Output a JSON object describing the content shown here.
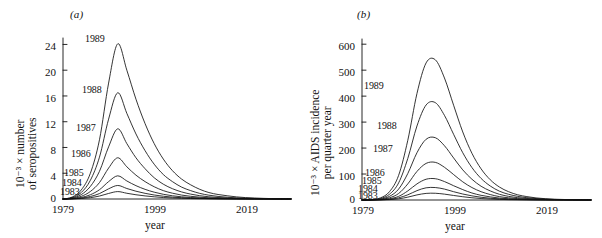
{
  "figure": {
    "panels": [
      {
        "tag": "(a)",
        "y_axis_label_line1": "10⁻³ × number",
        "y_axis_label_line2": "of seropositives",
        "x_axis_label": "year",
        "y_ticks": [
          "0",
          "4",
          "8",
          "12",
          "16",
          "20",
          "24"
        ],
        "x_ticks": [
          "1979",
          "1999",
          "2019"
        ],
        "curve_labels": [
          "1989",
          "1988",
          "1987",
          "1986",
          "1985",
          "1984",
          "1983"
        ]
      },
      {
        "tag": "(b)",
        "y_axis_label_line1": "10⁻³ × AIDS incidence",
        "y_axis_label_line2": "per quarter year",
        "x_axis_label": "year",
        "y_ticks": [
          "0",
          "100",
          "200",
          "300",
          "400",
          "500",
          "600"
        ],
        "x_ticks": [
          "1979",
          "1999",
          "2019"
        ],
        "curve_labels": [
          "1989",
          "1988",
          "1987",
          "1986",
          "1985",
          "1984",
          "1983"
        ]
      }
    ]
  },
  "chart_data": [
    {
      "type": "line",
      "panel": "(a)",
      "title": "",
      "xlabel": "year",
      "ylabel": "10^-3 x number of seropositives",
      "xlim": [
        1979,
        2029
      ],
      "ylim": [
        0,
        25
      ],
      "ytick_values": [
        0,
        4,
        8,
        12,
        16,
        20,
        24
      ],
      "xtick_values": [
        1979,
        1999,
        2019
      ],
      "grid": false,
      "legend": "inline curve labels",
      "x": [
        1979,
        1981,
        1983,
        1985,
        1987,
        1989,
        1991,
        1993,
        1995,
        1997,
        1999,
        2001,
        2003,
        2005,
        2007,
        2009,
        2011,
        2013,
        2015,
        2017,
        2019,
        2021,
        2023,
        2025,
        2027,
        2029
      ],
      "series": [
        {
          "name": "1989",
          "peak_year": 1990,
          "peak_value": 24.1,
          "values": [
            0,
            0.3,
            1.4,
            4.0,
            9.2,
            18.0,
            24.1,
            20.0,
            15.5,
            11.7,
            8.6,
            6.2,
            4.4,
            3.1,
            2.2,
            1.5,
            1.0,
            0.7,
            0.5,
            0.33,
            0.22,
            0.15,
            0.1,
            0.06,
            0.04,
            0.02
          ]
        },
        {
          "name": "1988",
          "peak_year": 1990,
          "peak_value": 16.5,
          "values": [
            0,
            0.22,
            1.0,
            2.9,
            6.5,
            12.4,
            16.5,
            13.3,
            10.1,
            7.5,
            5.4,
            3.8,
            2.7,
            1.85,
            1.3,
            0.87,
            0.59,
            0.4,
            0.27,
            0.18,
            0.12,
            0.08,
            0.05,
            0.033,
            0.02,
            0.012
          ]
        },
        {
          "name": "1987",
          "peak_year": 1990,
          "peak_value": 10.9,
          "values": [
            0,
            0.15,
            0.68,
            1.95,
            4.3,
            8.1,
            10.9,
            8.6,
            6.4,
            4.7,
            3.3,
            2.3,
            1.6,
            1.1,
            0.76,
            0.51,
            0.34,
            0.23,
            0.155,
            0.1,
            0.068,
            0.045,
            0.03,
            0.019,
            0.012,
            0.007
          ]
        },
        {
          "name": "1986",
          "peak_year": 1990,
          "peak_value": 6.4,
          "values": [
            0,
            0.09,
            0.41,
            1.17,
            2.55,
            4.8,
            6.4,
            5.0,
            3.7,
            2.7,
            1.9,
            1.3,
            0.9,
            0.61,
            0.42,
            0.28,
            0.19,
            0.13,
            0.085,
            0.056,
            0.037,
            0.024,
            0.016,
            0.01,
            0.006,
            0.004
          ]
        },
        {
          "name": "1985",
          "peak_year": 1990,
          "peak_value": 3.6,
          "values": [
            0,
            0.05,
            0.23,
            0.66,
            1.44,
            2.7,
            3.6,
            2.8,
            2.07,
            1.5,
            1.06,
            0.73,
            0.5,
            0.34,
            0.23,
            0.155,
            0.1,
            0.07,
            0.047,
            0.031,
            0.02,
            0.013,
            0.009,
            0.005,
            0.003,
            0.002
          ]
        },
        {
          "name": "1984",
          "peak_year": 1990,
          "peak_value": 2.1,
          "values": [
            0,
            0.03,
            0.135,
            0.39,
            0.84,
            1.58,
            2.1,
            1.63,
            1.21,
            0.88,
            0.62,
            0.43,
            0.29,
            0.2,
            0.135,
            0.09,
            0.06,
            0.04,
            0.027,
            0.018,
            0.012,
            0.008,
            0.005,
            0.003,
            0.002,
            0.001
          ]
        },
        {
          "name": "1983",
          "peak_year": 1990,
          "peak_value": 1.15,
          "values": [
            0,
            0.016,
            0.074,
            0.21,
            0.46,
            0.86,
            1.15,
            0.89,
            0.66,
            0.48,
            0.34,
            0.23,
            0.16,
            0.11,
            0.074,
            0.049,
            0.033,
            0.022,
            0.015,
            0.01,
            0.006,
            0.004,
            0.003,
            0.002,
            0.001,
            0.0005
          ]
        }
      ]
    },
    {
      "type": "line",
      "panel": "(b)",
      "title": "",
      "xlabel": "year",
      "ylabel": "10^-3 x AIDS incidence per quarter year",
      "xlim": [
        1979,
        2029
      ],
      "ylim": [
        0,
        620
      ],
      "ytick_values": [
        0,
        100,
        200,
        300,
        400,
        500,
        600
      ],
      "xtick_values": [
        1979,
        1999,
        2019
      ],
      "grid": false,
      "legend": "inline curve labels",
      "x": [
        1979,
        1981,
        1983,
        1985,
        1987,
        1989,
        1991,
        1993,
        1995,
        1997,
        1999,
        2001,
        2003,
        2005,
        2007,
        2009,
        2011,
        2013,
        2015,
        2017,
        2019,
        2021,
        2023,
        2025,
        2027,
        2029
      ],
      "series": [
        {
          "name": "1989",
          "peak_year": 1993,
          "peak_value": 540,
          "values": [
            0,
            1,
            8,
            32,
            95,
            230,
            410,
            528,
            540,
            470,
            365,
            262,
            180,
            120,
            78,
            50,
            32,
            20,
            13,
            8,
            5,
            3,
            2,
            1.2,
            0.7,
            0.4
          ]
        },
        {
          "name": "1988",
          "peak_year": 1993,
          "peak_value": 375,
          "values": [
            0,
            0.7,
            5.5,
            22,
            66,
            160,
            285,
            366,
            375,
            326,
            253,
            182,
            125,
            83,
            54,
            34,
            22,
            14,
            9,
            5.5,
            3.5,
            2.1,
            1.3,
            0.8,
            0.5,
            0.3
          ]
        },
        {
          "name": "1987",
          "peak_year": 1993,
          "peak_value": 240,
          "values": [
            0,
            0.45,
            3.5,
            14,
            42,
            102,
            182,
            234,
            240,
            209,
            162,
            116,
            80,
            53,
            35,
            22,
            14,
            9,
            5.7,
            3.6,
            2.2,
            1.4,
            0.8,
            0.5,
            0.3,
            0.2
          ]
        },
        {
          "name": "1986",
          "peak_year": 1993,
          "peak_value": 145,
          "values": [
            0,
            0.27,
            2.1,
            8.5,
            25,
            62,
            110,
            141,
            145,
            126,
            98,
            70,
            48,
            32,
            21,
            13,
            8.5,
            5.4,
            3.4,
            2.2,
            1.4,
            0.8,
            0.5,
            0.3,
            0.2,
            0.1
          ]
        },
        {
          "name": "1985",
          "peak_year": 1993,
          "peak_value": 82,
          "values": [
            0,
            0.15,
            1.2,
            4.8,
            14,
            35,
            62,
            80,
            82,
            71,
            55,
            40,
            27,
            18,
            12,
            7.4,
            4.8,
            3.1,
            1.9,
            1.2,
            0.8,
            0.5,
            0.3,
            0.2,
            0.1,
            0.05
          ]
        },
        {
          "name": "1984",
          "peak_year": 1993,
          "peak_value": 48,
          "values": [
            0,
            0.09,
            0.7,
            2.8,
            8.3,
            20,
            36,
            47,
            48,
            42,
            32,
            23,
            16,
            10.6,
            6.9,
            4.4,
            2.8,
            1.8,
            1.1,
            0.7,
            0.45,
            0.28,
            0.17,
            0.1,
            0.06,
            0.03
          ]
        },
        {
          "name": "1983",
          "peak_year": 1993,
          "peak_value": 26,
          "values": [
            0,
            0.05,
            0.38,
            1.5,
            4.5,
            11,
            19.6,
            25.4,
            26,
            22.6,
            17.5,
            12.6,
            8.6,
            5.7,
            3.7,
            2.4,
            1.5,
            0.96,
            0.6,
            0.38,
            0.24,
            0.15,
            0.09,
            0.055,
            0.03,
            0.018
          ]
        }
      ]
    }
  ]
}
